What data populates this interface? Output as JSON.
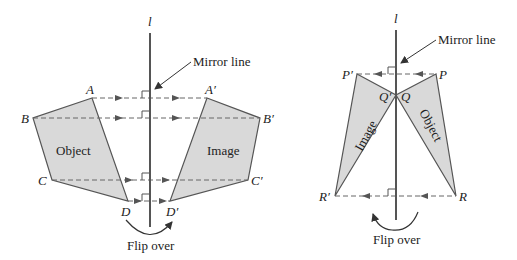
{
  "left_figure": {
    "mirror_symbol": "l",
    "mirror_label": "Mirror line",
    "object_label": "Object",
    "image_label": "Image",
    "flip_label": "Flip over",
    "points": {
      "A": "A",
      "B": "B",
      "C": "C",
      "D": "D",
      "A1": "A′",
      "B1": "B′",
      "C1": "C′",
      "D1": "D′"
    }
  },
  "right_figure": {
    "mirror_symbol": "l",
    "mirror_label": "Mirror line",
    "object_label": "Object",
    "image_label": "Image",
    "flip_label": "Flip over",
    "points": {
      "P": "P",
      "Q": "Q",
      "R": "R",
      "P1": "P′",
      "Q1": "Q′",
      "R1": "R′"
    }
  },
  "colors": {
    "fill": "#d9d9d9",
    "stroke": "#555555",
    "mirror": "#555555",
    "text": "#222222"
  }
}
